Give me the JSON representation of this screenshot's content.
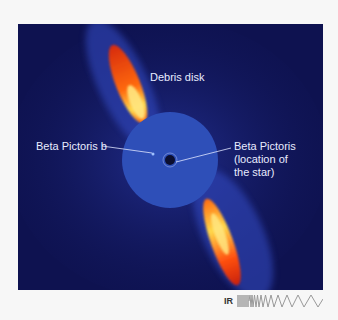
{
  "image": {
    "title": "Beta Pictoris debris disk (infrared)",
    "background_color": "#0e1250",
    "labels": {
      "debris_disk": "Debris disk",
      "planet": "Beta Pictoris b",
      "star_line1": "Beta Pictoris",
      "star_line2": "(location of",
      "star_line3": "the star)"
    }
  },
  "spectrum_key": {
    "band": "IR",
    "icon": "wavelength-spectrum-icon"
  }
}
